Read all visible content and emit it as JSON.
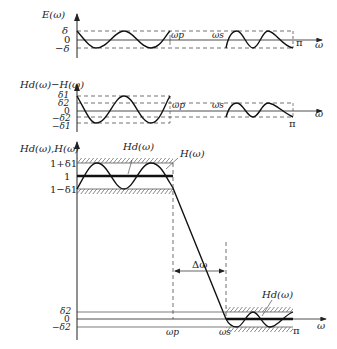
{
  "figure": {
    "panels": [
      {
        "id": "error",
        "ylabel": "E(ω)",
        "xlabel": "ω",
        "yticks": [
          "δ",
          "0",
          "−δ"
        ],
        "markers": [
          "ωp",
          "ωs",
          "π"
        ]
      },
      {
        "id": "difference",
        "ylabel": "Hd(ω)−H(ω)",
        "xlabel": "ω",
        "yticks": [
          "δ1",
          "δ2",
          "0",
          "−δ2",
          "−δ1"
        ],
        "markers": [
          "ωp",
          "ωs",
          "π"
        ]
      },
      {
        "id": "response",
        "ylabel": "Hd(ω),H(ω)",
        "xlabel": "ω",
        "yticks": [
          "1+δ1",
          "1",
          "1−δ1",
          "δ2",
          "0",
          "−δ2"
        ],
        "markers": [
          "ωp",
          "ωs",
          "π"
        ],
        "annotations": [
          "Hd(ω)",
          "H(ω)",
          "Δω",
          "Hd(ω)"
        ]
      }
    ]
  },
  "labels": {
    "p1_ylabel": "E(ω)",
    "p1_delta": "δ",
    "p1_zero": "0",
    "p1_mdelta": "−δ",
    "p1_wp": "ωp",
    "p1_ws": "ωs",
    "p1_pi": "π",
    "p1_w": "ω",
    "p2_ylabel": "Hd(ω)−H(ω)",
    "p2_d1": "δ1",
    "p2_d2": "δ2",
    "p2_zero": "0",
    "p2_md2": "−δ2",
    "p2_md1": "−δ1",
    "p2_wp": "ωp",
    "p2_ws": "ωs",
    "p2_pi": "π",
    "p2_w": "ω",
    "p3_ylabel": "Hd(ω),H(ω)",
    "p3_1pd1": "1+δ1",
    "p3_one": "1",
    "p3_1md1": "1−δ1",
    "p3_hd_pass": "Hd(ω)",
    "p3_h": "H(ω)",
    "p3_dw": "Δω",
    "p3_hd_stop": "Hd(ω)",
    "p3_d2": "δ2",
    "p3_zero": "0",
    "p3_md2": "−δ2",
    "p3_wp": "ωp",
    "p3_ws": "ωs",
    "p3_pi": "π",
    "p3_w": "ω"
  }
}
